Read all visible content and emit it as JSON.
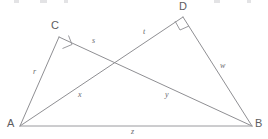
{
  "figure": {
    "type": "geometry-diagram",
    "canvas": {
      "width": 268,
      "height": 139
    },
    "colors": {
      "background": "#ffffff",
      "stroke": "#8f8f93",
      "vertex_label": "#5d5d61",
      "segment_label": "#6a6a6e"
    },
    "vertices": [
      {
        "id": "A",
        "label": "A",
        "x": 20,
        "y": 126,
        "label_x": 9,
        "label_y": 120
      },
      {
        "id": "B",
        "label": "B",
        "x": 252,
        "y": 126,
        "label_x": 255,
        "label_y": 120
      },
      {
        "id": "C",
        "label": "C",
        "x": 59,
        "y": 37,
        "label_x": 51,
        "label_y": 21
      },
      {
        "id": "D",
        "label": "D",
        "x": 183,
        "y": 17,
        "label_x": 179,
        "label_y": 2
      }
    ],
    "segments": [
      {
        "id": "r",
        "label": "r",
        "from": "A",
        "to": "C",
        "label_x": 33,
        "label_y": 69
      },
      {
        "id": "s",
        "label": "s",
        "from": "C",
        "to": "B",
        "label_x": 92,
        "label_y": 38
      },
      {
        "id": "t",
        "label": "t",
        "from": "A",
        "to": "D",
        "label_x": 143,
        "label_y": 29
      },
      {
        "id": "w",
        "label": "w",
        "from": "D",
        "to": "B",
        "label_x": 220,
        "label_y": 63
      },
      {
        "id": "x",
        "label": "x",
        "from": "A",
        "to": "intersection",
        "label_x": 78,
        "label_y": 92
      },
      {
        "id": "y",
        "label": "y",
        "from": "intersection",
        "to": "B",
        "label_x": 165,
        "label_y": 92
      },
      {
        "id": "z",
        "label": "z",
        "from": "A",
        "to": "B",
        "label_x": 131,
        "label_y": 129
      }
    ],
    "right_angles": [
      {
        "at": "C",
        "marker": "right-angle-square"
      },
      {
        "at": "D",
        "marker": "right-angle-square"
      }
    ],
    "intersection": {
      "x": 115,
      "y": 62
    }
  }
}
